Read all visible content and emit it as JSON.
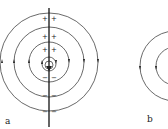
{
  "figure": {
    "panels": [
      {
        "id": "a",
        "label": "a",
        "description": "Concentric field lines around a vertical conductor with + and - charges"
      },
      {
        "id": "b",
        "label": "b",
        "description": "Concentric field lines (partially cropped)"
      }
    ],
    "symbols": {
      "plus": "+",
      "minus": "−"
    },
    "colors": {
      "line": "#333333",
      "background": "#ffffff"
    }
  }
}
